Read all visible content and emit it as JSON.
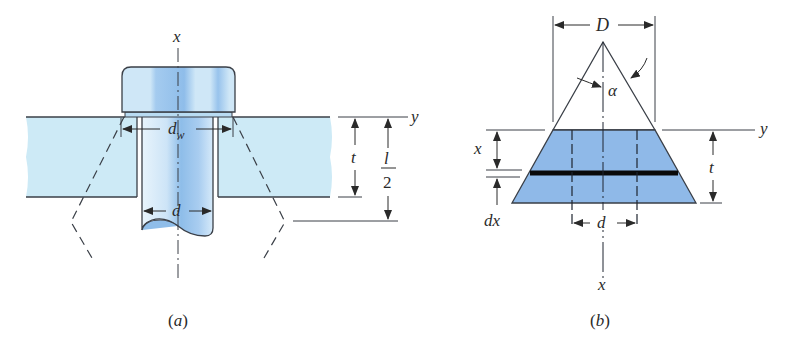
{
  "figure_a": {
    "caption": "(a)",
    "axis_x_label": "x",
    "axis_y_label": "y",
    "washer_diameter_label": "d",
    "washer_diameter_subscript": "w",
    "bolt_diameter_label": "d",
    "thickness_label": "t",
    "half_length_numerator": "l",
    "half_length_denominator": "2"
  },
  "figure_b": {
    "caption": "(b)",
    "axis_x_top_label": "x",
    "axis_x_bottom_label": "x",
    "axis_y_label": "y",
    "cone_diameter_label": "D",
    "angle_label": "α",
    "element_thickness_label": "dx",
    "thickness_label": "t",
    "hole_diameter_label": "d"
  },
  "colors": {
    "plate_fill": "#cdeaf6",
    "bolt_fill": "#a8cdf0",
    "frustum_fill": "#8fb9e8",
    "line": "#3a3f47"
  }
}
